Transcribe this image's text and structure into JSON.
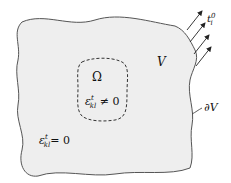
{
  "diagram": {
    "region_label": "V",
    "boundary_label": "∂V",
    "inclusion_label": "Ω",
    "traction": {
      "base": "t",
      "sub": "i",
      "sup": "0"
    },
    "inside_strain": {
      "base": "ε",
      "sub": "kl",
      "sup": "t",
      "relation": "≠ 0"
    },
    "outside_strain": {
      "base": "ε",
      "sub": "kl",
      "sup": "t",
      "relation": "= 0"
    },
    "colors": {
      "fill": "#eeeeee",
      "stroke": "#555555",
      "text": "#111111"
    }
  }
}
